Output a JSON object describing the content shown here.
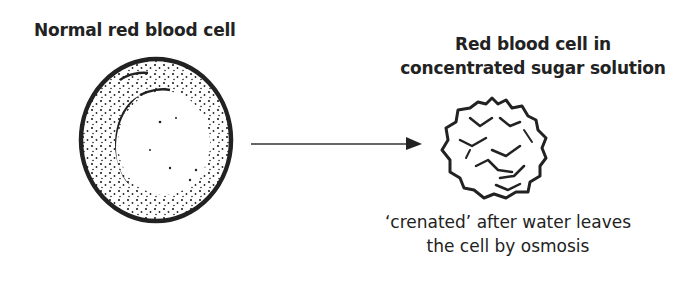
{
  "diagram": {
    "normal_cell": {
      "title": "Normal red blood cell"
    },
    "arrow": {
      "direction": "right"
    },
    "crenated_cell": {
      "title_line1": "Red blood cell in",
      "title_line2": "concentrated sugar solution",
      "caption_line1": "‘crenated’ after water leaves",
      "caption_line2": "the cell by osmosis"
    },
    "colors": {
      "ink": "#222222",
      "background": "#ffffff"
    }
  }
}
